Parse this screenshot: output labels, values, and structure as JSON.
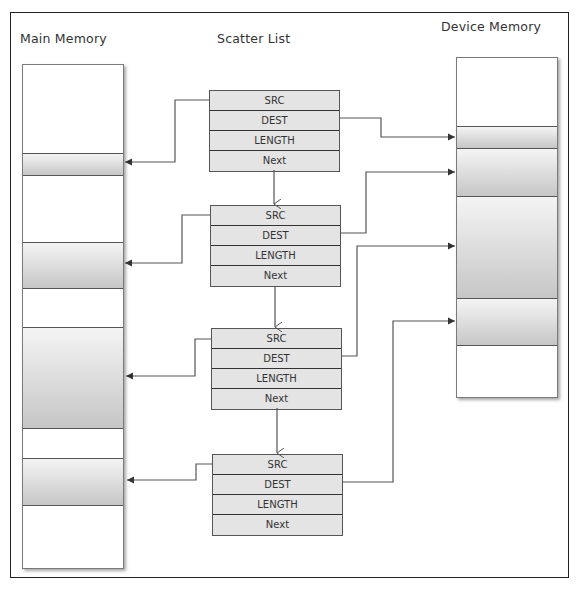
{
  "titles": {
    "main_memory": "Main Memory",
    "scatter_list": "Scatter List",
    "device_memory": "Device Memory"
  },
  "scatter_list": {
    "entries": [
      {
        "fields": [
          "SRC",
          "DEST",
          "LENGTH",
          "Next"
        ]
      },
      {
        "fields": [
          "SRC",
          "DEST",
          "LENGTH",
          "Next"
        ]
      },
      {
        "fields": [
          "SRC",
          "DEST",
          "LENGTH",
          "Next"
        ]
      },
      {
        "fields": [
          "SRC",
          "DEST",
          "LENGTH",
          "Next"
        ]
      }
    ]
  },
  "main_memory": {
    "segments": 4
  },
  "device_memory": {
    "segments": 4
  },
  "colors": {
    "line": "#444444",
    "box_fill": "#e4e4e4",
    "band_dark": "#c6c6c6",
    "band_light": "#f4f4f4"
  }
}
